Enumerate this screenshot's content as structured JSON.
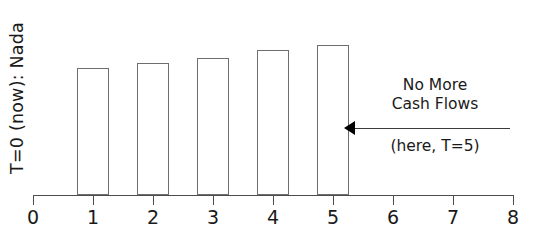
{
  "chart_data": {
    "type": "bar",
    "title": "",
    "subtitle": "",
    "xlabel": "",
    "ylabel": "T=0 (now):  Nada",
    "categories": [
      "1",
      "2",
      "3",
      "4",
      "5"
    ],
    "values": [
      1.0,
      1.04,
      1.08,
      1.14,
      1.18
    ],
    "x": [
      1,
      2,
      3,
      4,
      5
    ],
    "xlim": [
      0,
      8
    ],
    "ylim": [
      0,
      1.38
    ],
    "xticks": [
      "0",
      "1",
      "2",
      "3",
      "4",
      "5",
      "6",
      "7",
      "8"
    ],
    "yticks": [],
    "grid": false,
    "legend": null,
    "bar_facecolor": "#ffffff",
    "bar_edgecolor": "#6e6e6e",
    "axis_color": "#4d4d4d",
    "text_color": "#1a1a1a",
    "annotations": [
      {
        "name": "no-more-cash-flows",
        "line1": "No More",
        "line2": "Cash Flows",
        "line3": "(here, T=5)",
        "arrow_direction": "left",
        "arrow_target_x": 5.2,
        "arrow_color": "#3a3a3a"
      }
    ]
  },
  "axis": {
    "ticks": [
      {
        "label": "0",
        "value": 0
      },
      {
        "label": "1",
        "value": 1
      },
      {
        "label": "2",
        "value": 2
      },
      {
        "label": "3",
        "value": 3
      },
      {
        "label": "4",
        "value": 4
      },
      {
        "label": "5",
        "value": 5
      },
      {
        "label": "6",
        "value": 6
      },
      {
        "label": "7",
        "value": 7
      },
      {
        "label": "8",
        "value": 8
      }
    ]
  },
  "annotation": {
    "line1": "No More",
    "line2": "Cash Flows",
    "line3": "(here, T=5)"
  },
  "ylabel": "T=0 (now):  Nada"
}
